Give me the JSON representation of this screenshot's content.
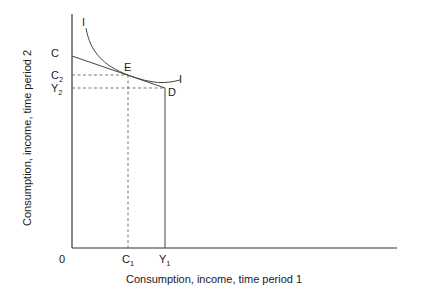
{
  "diagram": {
    "type": "intertemporal-consumption-choice",
    "x_axis_label": "Consumption, income, time period 1",
    "y_axis_label": "Consumption, income, time period 2",
    "origin_label": "0",
    "x_ticks": [
      {
        "base": "C",
        "sub": "1"
      },
      {
        "base": "Y",
        "sub": "1"
      }
    ],
    "y_ticks": [
      {
        "base": "C",
        "sub": ""
      },
      {
        "base": "C",
        "sub": "2"
      },
      {
        "base": "Y",
        "sub": "2"
      }
    ],
    "points": {
      "endowment": "D",
      "optimum": "E"
    },
    "curves": {
      "indifference_label_top": "I",
      "indifference_label_right": "I"
    },
    "colors": {
      "line": "#444444",
      "text": "#1a1a1a",
      "background": "#ffffff"
    }
  }
}
